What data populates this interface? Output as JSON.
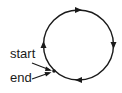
{
  "diagram": {
    "type": "closed-loop",
    "direction": "clockwise",
    "labels": {
      "start": "start",
      "end": "end"
    },
    "colors": {
      "stroke": "#1a1a1a",
      "background": "#ffffff"
    },
    "arrows": [
      {
        "position": "top",
        "points": "right"
      },
      {
        "position": "right",
        "points": "down"
      },
      {
        "position": "bottom",
        "points": "left"
      },
      {
        "position": "left",
        "points": "up"
      }
    ]
  }
}
